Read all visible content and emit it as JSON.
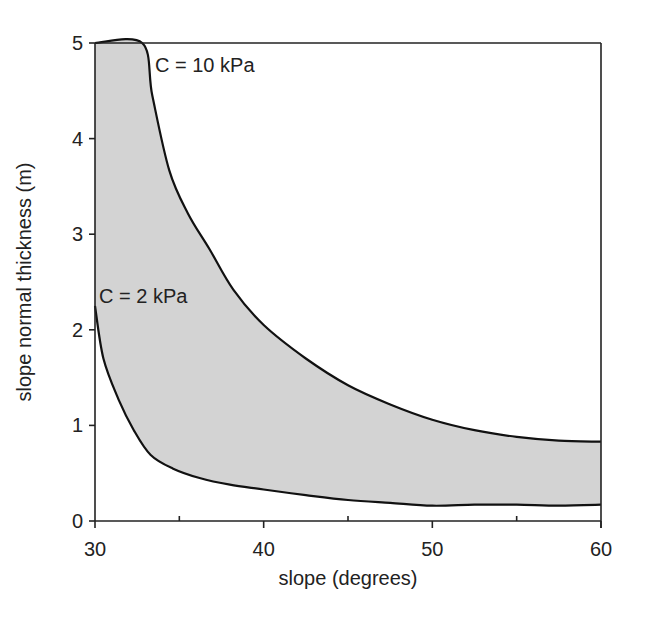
{
  "chart_data": {
    "type": "area",
    "title": "",
    "xlabel": "slope (degrees)",
    "ylabel": "slope normal thickness (m)",
    "xlim": [
      30,
      60
    ],
    "ylim": [
      0,
      5
    ],
    "xticks": [
      30,
      40,
      50,
      60
    ],
    "xminor_ticks": [
      35,
      45,
      55
    ],
    "yticks": [
      0,
      1,
      2,
      3,
      4,
      5
    ],
    "grid": false,
    "legend": null,
    "fill_between_series": true,
    "fill_color": "#d3d3d3",
    "line_color": "#111111",
    "series": [
      {
        "name": "C = 10 kPa",
        "x": [
          30.0,
          32.8,
          33.4,
          34.4,
          35.5,
          36.8,
          38.2,
          40.0,
          42.5,
          45.0,
          47.5,
          50.0,
          52.5,
          55.0,
          57.5,
          60.0
        ],
        "y": [
          5.0,
          5.0,
          4.45,
          3.67,
          3.22,
          2.84,
          2.42,
          2.05,
          1.7,
          1.42,
          1.22,
          1.06,
          0.95,
          0.88,
          0.84,
          0.83
        ]
      },
      {
        "name": "C = 2 kPa",
        "x": [
          30.0,
          30.5,
          31.4,
          32.3,
          33.3,
          34.6,
          36.2,
          38.0,
          40.0,
          42.5,
          45.0,
          47.5,
          50.0,
          52.5,
          55.0,
          57.5,
          60.0
        ],
        "y": [
          2.25,
          1.7,
          1.27,
          0.95,
          0.69,
          0.55,
          0.45,
          0.38,
          0.33,
          0.27,
          0.22,
          0.19,
          0.16,
          0.17,
          0.17,
          0.16,
          0.17
        ]
      }
    ],
    "annotations": [
      {
        "text": "C = 10 kPa",
        "x": 34.0,
        "y": 4.75
      },
      {
        "text": "C = 2 kPa",
        "x": 30.2,
        "y": 2.3
      }
    ]
  },
  "labels": {
    "xlabel": "slope (degrees)",
    "ylabel": "slope normal thickness (m)",
    "annot_upper": "C = 10 kPa",
    "annot_lower": "C = 2 kPa"
  }
}
